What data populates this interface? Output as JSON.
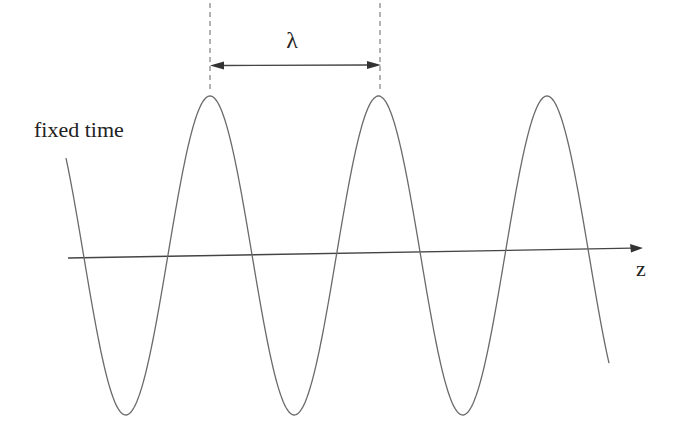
{
  "diagram": {
    "label_fixed_time": "fixed time",
    "label_wavelength": "λ",
    "label_axis": "z",
    "colors": {
      "background": "#ffffff",
      "wave": "#6a6a6a",
      "axis": "#444444",
      "text": "#222222"
    },
    "axis": {
      "x1": 68,
      "y1": 258,
      "x2": 643,
      "y2": 248
    },
    "wave": {
      "x_start": 66,
      "x_end": 609,
      "peak_y": 96,
      "trough_y": 415,
      "peaks_x": [
        210,
        380,
        547
      ],
      "troughs_x": [
        127,
        298,
        465
      ]
    },
    "wavelength_marker": {
      "x1": 210,
      "x2": 380,
      "y": 65,
      "dash_top": 3,
      "dash_bottom": 92
    }
  }
}
